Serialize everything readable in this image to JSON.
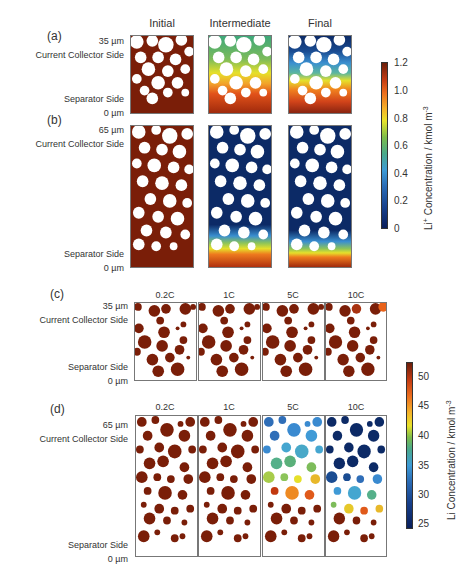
{
  "figure": {
    "panel_a": {
      "letter": "(a)",
      "columns": [
        "Initial",
        "Intermediate",
        "Final"
      ],
      "top_depth": "35 µm",
      "top_side": "Current Collector Side",
      "bottom_side": "Separator Side",
      "bottom_depth": "0 µm"
    },
    "panel_b": {
      "letter": "(b)",
      "top_depth": "65 µm",
      "top_side": "Current Collector Side",
      "bottom_side": "Separator Side",
      "bottom_depth": "0 µm"
    },
    "colorbar_electrolyte": {
      "ticks": [
        "1.2",
        "1.0",
        "0.8",
        "0.6",
        "0.4",
        "0.2",
        "0"
      ],
      "label_main": "Li",
      "label_sup1": "+",
      "label_rest": " Concentration / kmol m",
      "label_sup2": "-3",
      "range": [
        0,
        1.2
      ],
      "colormap": "jet-like (dark blue to dark red)"
    },
    "panel_c": {
      "letter": "(c)",
      "columns": [
        "0.2C",
        "1C",
        "5C",
        "10C"
      ],
      "top_depth": "35 µm",
      "top_side": "Current Collector Side",
      "bottom_side": "Separator Side",
      "bottom_depth": "0 µm"
    },
    "panel_d": {
      "letter": "(d)",
      "columns": [
        "0.2C",
        "1C",
        "5C",
        "10C"
      ],
      "top_depth": "65 µm",
      "top_side": "Current Collector Side",
      "bottom_side": "Separator Side",
      "bottom_depth": "0 µm"
    },
    "colorbar_solid": {
      "ticks": [
        "50",
        "45",
        "40",
        "35",
        "30",
        "25"
      ],
      "label_main": "Li Concentration / kmol m",
      "label_sup": "-3",
      "range": [
        24,
        52
      ],
      "colormap": "jet-like (dark blue to dark red)"
    },
    "colors": {
      "dark_red": "#7a1e08",
      "dark_blue": "#0c2a66",
      "frame": "#777777"
    }
  }
}
